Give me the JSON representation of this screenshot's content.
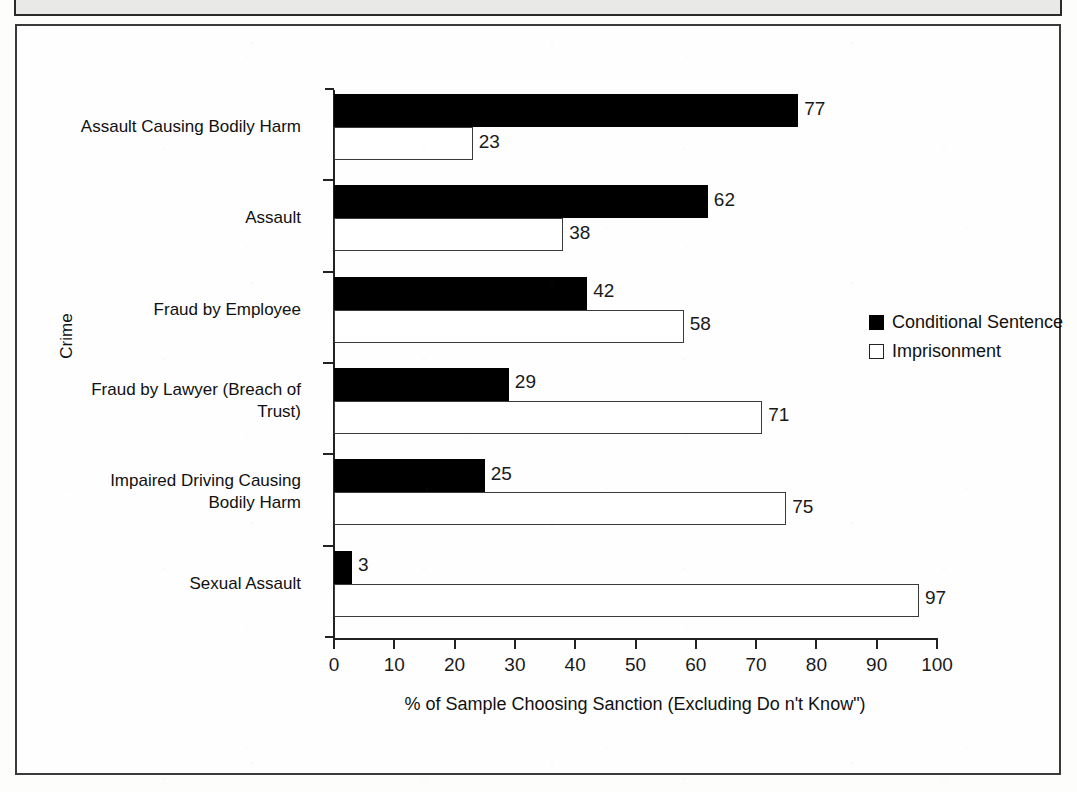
{
  "figure": {
    "caption": "Figure 4: Public Support for Conditional Sentencing Across Offence Types",
    "frame_border_color": "#3a3a3a"
  },
  "legend": {
    "position": "right",
    "entries": [
      {
        "label": "Conditional Sentence",
        "swatch": "filled-black-square",
        "color": "#000000"
      },
      {
        "label": "Imprisonment",
        "swatch": "outlined-white-square",
        "color": "#ffffff"
      }
    ]
  },
  "chart_data": {
    "type": "bar",
    "orientation": "horizontal",
    "title": "",
    "xlabel": "% of Sample Choosing Sanction (Excluding Do  n't Know\")",
    "ylabel": "Crime",
    "xlim": [
      0,
      100
    ],
    "xticks": [
      "0",
      "10",
      "20",
      "30",
      "40",
      "50",
      "60",
      "70",
      "80",
      "90",
      "100"
    ],
    "grid": false,
    "categories": [
      "Assault Causing Bodily Harm",
      "Assault",
      "Fraud by Employee",
      "Fraud by Lawyer (Breach of Trust)",
      "Impaired Driving Causing Bodily Harm",
      "Sexual Assault"
    ],
    "category_lines": [
      [
        "Assault Causing Bodily Harm"
      ],
      [
        "Assault"
      ],
      [
        "Fraud by Employee"
      ],
      [
        "Fraud by Lawyer (Breach of",
        "Trust)"
      ],
      [
        "Impaired Driving Causing",
        "Bodily Harm"
      ],
      [
        "Sexual Assault"
      ]
    ],
    "series": [
      {
        "name": "Conditional Sentence",
        "color": "#000000",
        "values": [
          77,
          62,
          42,
          29,
          25,
          3
        ]
      },
      {
        "name": "Imprisonment",
        "color": "#ffffff",
        "values": [
          23,
          38,
          58,
          71,
          75,
          97
        ]
      }
    ]
  }
}
